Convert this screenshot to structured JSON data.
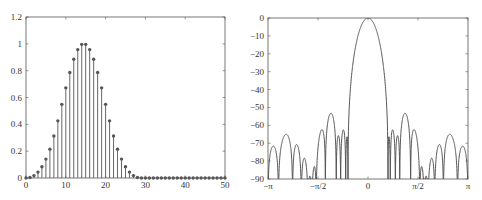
{
  "chart_data": [
    {
      "type": "stem",
      "title": "",
      "xlabel": "",
      "ylabel": "",
      "xlim": [
        0,
        50
      ],
      "ylim": [
        0,
        1.2
      ],
      "grid": false,
      "x_ticks": [
        0,
        10,
        20,
        30,
        40,
        50
      ],
      "x_tick_labels": [
        "0",
        "10",
        "20",
        "30",
        "40",
        "50"
      ],
      "y_ticks": [
        0,
        0.2,
        0.4,
        0.6,
        0.8,
        1.0,
        1.2
      ],
      "y_tick_labels": [
        "0",
        "0.2",
        "0.4",
        "0.6",
        "0.8",
        "1",
        "1.2"
      ],
      "x": [
        0,
        1,
        2,
        3,
        4,
        5,
        6,
        7,
        8,
        9,
        10,
        11,
        12,
        13,
        14,
        15,
        16,
        17,
        18,
        19,
        20,
        21,
        22,
        23,
        24,
        25,
        26,
        27,
        28,
        29,
        30,
        31,
        32,
        33,
        34,
        35,
        36,
        37,
        38,
        39,
        40,
        41,
        42,
        43,
        44,
        45,
        46,
        47,
        48,
        49,
        50
      ],
      "values": [
        0.0,
        0.004,
        0.018,
        0.044,
        0.084,
        0.141,
        0.215,
        0.313,
        0.426,
        0.549,
        0.672,
        0.786,
        0.885,
        0.957,
        0.996,
        0.996,
        0.957,
        0.885,
        0.786,
        0.672,
        0.549,
        0.426,
        0.313,
        0.215,
        0.141,
        0.084,
        0.044,
        0.018,
        0.004,
        0.0,
        0.0,
        0.0,
        0.0,
        0.0,
        0.0,
        0.0,
        0.0,
        0.0,
        0.0,
        0.0,
        0.0,
        0.0,
        0.0,
        0.0,
        0.0,
        0.0,
        0.0,
        0.0,
        0.0,
        0.0,
        0.0
      ],
      "marker": "filled-circle",
      "color": "#555555"
    },
    {
      "type": "line",
      "title": "",
      "xlabel": "",
      "ylabel": "",
      "xlim": [
        -3.14159,
        3.14159
      ],
      "ylim": [
        -90,
        0
      ],
      "grid": false,
      "x_ticks": [
        -3.14159,
        -1.5708,
        0,
        1.5708,
        3.14159
      ],
      "x_tick_labels": [
        "−π",
        "−π/2",
        "0",
        "π/2",
        "π"
      ],
      "y_ticks": [
        0,
        -10,
        -20,
        -30,
        -40,
        -50,
        -60,
        -70,
        -80,
        -90
      ],
      "y_tick_labels": [
        "0",
        "−10",
        "−20",
        "−30",
        "−40",
        "−50",
        "−60",
        "−70",
        "−80",
        "−90"
      ],
      "description": "Magnitude response in dB of the 30-point window; main lobe peaks at 0 dB at ω=0 with first nulls near ±0.87 rad; sidelobes decay from about −58 dB near the main lobe to below −88 dB near ±π.",
      "main_lobe": {
        "peak_db": 0,
        "null_rad": [
          -0.87,
          0.87
        ]
      },
      "sidelobe_peaks_db_right": [
        -58.5,
        -59.5,
        -63.5,
        -67.5,
        -71,
        -74.5,
        -78,
        -81,
        -84.5,
        -88.5
      ],
      "sidelobe_peaks_db_left": [
        -58.5,
        -59.5,
        -63.5,
        -67.5,
        -71,
        -74.5,
        -78,
        -81,
        -84.5,
        -88.5
      ],
      "color": "#555555"
    }
  ]
}
